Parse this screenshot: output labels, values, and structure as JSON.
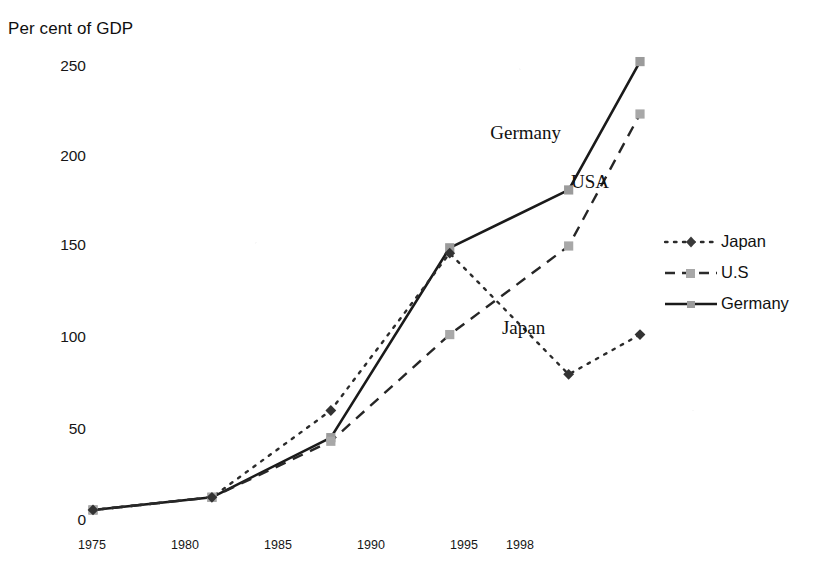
{
  "chart_data": {
    "type": "line",
    "title": "",
    "ylabel": "Per cent of GDP",
    "xlabel": "",
    "categories": [
      "1975",
      "1980",
      "1985",
      "1990",
      "1995",
      "1998"
    ],
    "x": [
      1975,
      1980,
      1985,
      1990,
      1995,
      1998
    ],
    "ylim": [
      0,
      250
    ],
    "xlim": [
      1975,
      1998
    ],
    "yticks": [
      "250",
      "200",
      "150",
      "100",
      "50",
      "0"
    ],
    "ytick_values": [
      250,
      200,
      150,
      100,
      50,
      0
    ],
    "grid": false,
    "legend_position": "right",
    "series": [
      {
        "name": "Japan",
        "values": [
          5,
          12,
          60,
          147,
          80,
          102
        ],
        "line_style": "dotted",
        "marker": "diamond",
        "color": "#2b2b2b"
      },
      {
        "name": "U.S",
        "values": [
          5,
          12,
          43,
          102,
          151,
          224
        ],
        "line_style": "dashed",
        "marker": "square",
        "color": "#2b2b2b"
      },
      {
        "name": "Germany",
        "values": [
          5,
          12,
          45,
          150,
          182,
          253
        ],
        "line_style": "solid",
        "marker": "square",
        "color": "#1a1a1a"
      }
    ],
    "annotations": [
      {
        "text": "Germany",
        "x": 1993.2,
        "y": 213
      },
      {
        "text": "USA",
        "x": 1995.9,
        "y": 186
      },
      {
        "text": "Japan",
        "x": 1993.1,
        "y": 105
      }
    ],
    "legend": [
      {
        "label": "Japan",
        "marker": "diamond",
        "line_style": "dotted"
      },
      {
        "label": "U.S",
        "marker": "square",
        "line_style": "dashed"
      },
      {
        "label": "Germany",
        "marker": "square",
        "line_style": "solid"
      }
    ]
  },
  "colors": {
    "background": "#ffffff",
    "japan": "#2b2b2b",
    "us": "#2b2b2b",
    "germany": "#1a1a1a",
    "marker_fill": "#9a9a9a",
    "text": "#111111"
  }
}
